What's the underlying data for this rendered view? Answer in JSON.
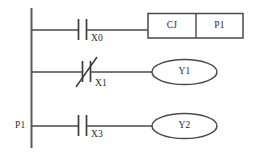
{
  "diagram": {
    "type": "ladder-logic",
    "line_color": "#4a4a4a",
    "text_color": "#2b2b2b",
    "background": "#ffffff",
    "left_rail": {
      "label": ""
    },
    "rungs": [
      {
        "id": "rung-1",
        "y": 30,
        "contacts": [
          {
            "id": "x0",
            "type": "normally-open",
            "label": "X0",
            "x": 82
          }
        ],
        "output": {
          "kind": "instruction-box",
          "cells": [
            {
              "name": "instruction",
              "text": "CJ"
            },
            {
              "name": "operand",
              "text": "P1"
            }
          ]
        }
      },
      {
        "id": "rung-2",
        "y": 72,
        "contacts": [
          {
            "id": "x1",
            "type": "normally-closed",
            "label": "X1",
            "x": 86
          }
        ],
        "output": {
          "kind": "coil",
          "label": "Y1"
        }
      },
      {
        "id": "rung-3",
        "y": 126,
        "rail_label": "P1",
        "contacts": [
          {
            "id": "x3",
            "type": "normally-open",
            "label": "X3",
            "x": 82
          }
        ],
        "output": {
          "kind": "coil",
          "label": "Y2"
        }
      }
    ]
  }
}
